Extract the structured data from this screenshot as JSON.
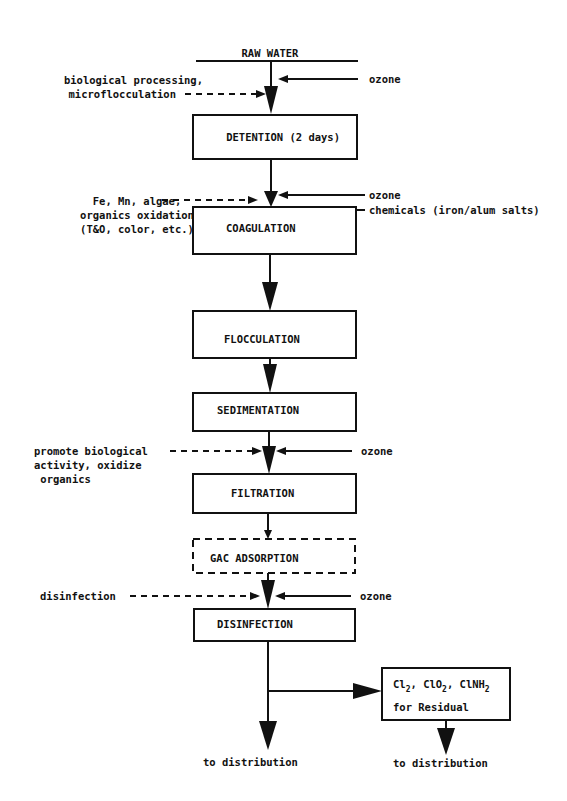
{
  "diagram": {
    "source": "RAW WATER",
    "steps": [
      {
        "id": "detention",
        "label": "DETENTION (2 days)"
      },
      {
        "id": "coagulation",
        "label": "COAGULATION"
      },
      {
        "id": "flocculation",
        "label": "FLOCCULATION"
      },
      {
        "id": "sedimentation",
        "label": "SEDIMENTATION"
      },
      {
        "id": "filtration",
        "label": "FILTRATION"
      },
      {
        "id": "gac",
        "label": "GAC ADSORPTION",
        "optional": true
      },
      {
        "id": "disinfection",
        "label": "DISINFECTION"
      }
    ],
    "inputs": {
      "ozone1": "ozone",
      "ozone2": "ozone",
      "chemicals": "chemicals (iron/alum salts)",
      "ozone3": "ozone",
      "ozone4": "ozone"
    },
    "purposes": {
      "p1": [
        "biological processing,",
        "microflocculation"
      ],
      "p2": [
        "Fe, Mn, algae,",
        "organics oxidation",
        "(T&O, color, etc.)"
      ],
      "p3": [
        "promote biological",
        "activity, oxidize",
        " organics"
      ],
      "p4": [
        "disinfection"
      ]
    },
    "residual": {
      "line1_parts": [
        "Cl",
        "2",
        ", ClO",
        "2",
        ", ClNH",
        "2"
      ],
      "line2": "for Residual"
    },
    "outputs": {
      "main": "to distribution",
      "residual": "to distribution"
    }
  }
}
